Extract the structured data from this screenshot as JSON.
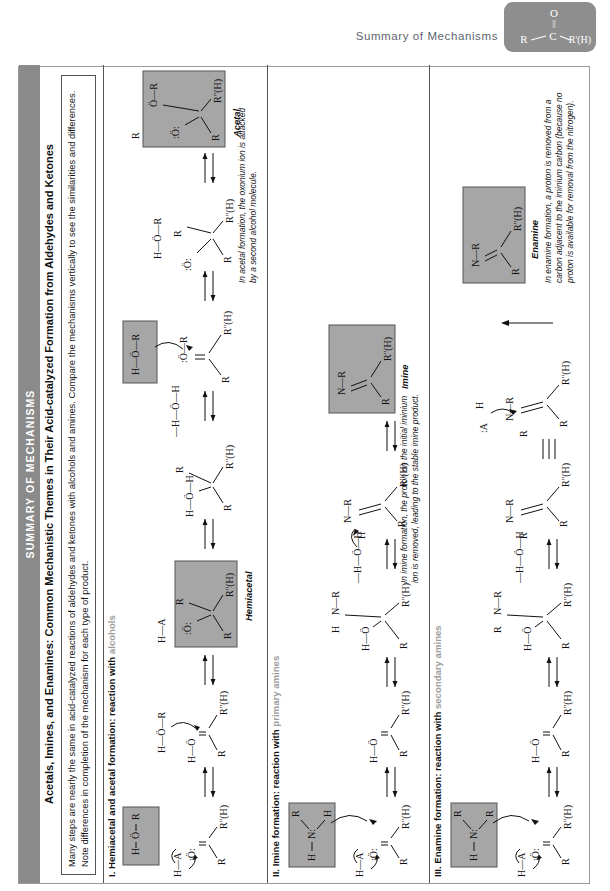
{
  "header": {
    "title": "Summary of Mechanisms",
    "badge_icon": "carbonyl-structure-icon",
    "badge_labels": {
      "o": "O",
      "r": "R",
      "c": "C",
      "rprime": "R'(H)"
    },
    "badge_color": "#8e8e8e"
  },
  "banner": {
    "text": "SUMMARY OF MECHANISMS",
    "color": "#8a8a8a"
  },
  "main_title": "Acetals, Imines, and Enamines:  Common Mechanistic Themes in Their Acid-catalyzed Formation from Aldehydes and Ketones",
  "intro": "Many steps are nearly the same in acid-catalyzed reactions of aldehydes and ketones with alcohols and amines.  Compare the mechanisms vertically to see the similarities and differences.  Note differences in completion of the mechanism for each type of product.",
  "accent_reagent_color": "#9d9d9d",
  "highlight_box_color": "#a6a6a6",
  "sections": [
    {
      "number": "I.",
      "title": "Hemiacetal and acetal formation: reaction with",
      "reagent": "alcohols",
      "reagent_box": {
        "labels": [
          "H",
          "O",
          "R"
        ],
        "name": "alcohol-reagent-box"
      },
      "start_material": {
        "left": "R",
        "right": "R''(H)",
        "carbonyl": "O"
      },
      "acid": "H—A",
      "nucleophile": "A",
      "intermediate_labels": [
        "R",
        "R'",
        "R''(H)",
        "O",
        "H"
      ],
      "product_boxes": [
        {
          "name": "hemiacetal-box",
          "label": "Hemiacetal"
        },
        {
          "name": "acetal-box",
          "label": "Acetal"
        }
      ],
      "note": "In acetal formation, the oxonium ion is attacked by a second alcohol molecule.",
      "note_lead": "acetal"
    },
    {
      "number": "II.",
      "title": "Imine formation: reaction with",
      "reagent": "primary amines",
      "reagent_box": {
        "labels": [
          "H",
          "N",
          "R",
          "H"
        ],
        "name": "primary-amine-reagent-box"
      },
      "start_material": {
        "left": "R",
        "right": "R''(H)",
        "carbonyl": "O"
      },
      "acid": "H—A",
      "nucleophile": "A",
      "leaving_group": "H—Ö—H",
      "product_boxes": [
        {
          "name": "imine-box",
          "label": "Imine"
        }
      ],
      "note": "In imine formation, the proton on the initial iminium ion is removed, leading to the stable imine product.",
      "note_lead": "imine"
    },
    {
      "number": "III.",
      "title": "Enamine formation: reaction with",
      "reagent": "secondary amines",
      "reagent_box": {
        "labels": [
          "H",
          "N",
          "R",
          "R"
        ],
        "name": "secondary-amine-reagent-box"
      },
      "start_material": {
        "left": "R",
        "right": "R''(H)",
        "carbonyl": "O"
      },
      "acid": "H—A",
      "nucleophile": "A",
      "leaving_group": "H—Ö—H",
      "product_boxes": [
        {
          "name": "enamine-box",
          "label": "Enamine"
        }
      ],
      "note": "In enamine formation, a proton is removed from a carbon adjacent to the iminium carbon (because no proton is available for removal from the nitrogen).",
      "note_lead": "enamine"
    }
  ]
}
